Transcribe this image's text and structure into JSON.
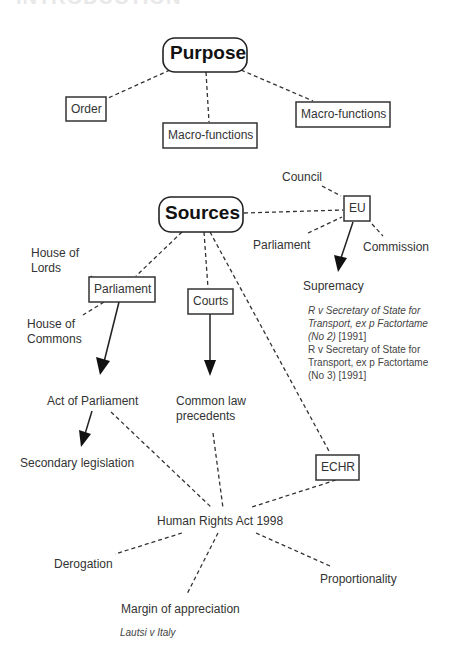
{
  "heading": "INTRODUCTION",
  "purpose": {
    "title": "Purpose",
    "children": [
      "Order",
      "Macro-functions",
      "Macro-functions"
    ]
  },
  "sources": {
    "title": "Sources",
    "eu": {
      "label": "EU",
      "institutions": [
        "Council",
        "Parliament",
        "Commission"
      ],
      "result": "Supremacy",
      "cases": [
        {
          "italic": "R v Secretary of State for Transport, ex p Factortame (No 2)",
          "line1": "R v Secretary of State for",
          "line2": "Transport, ex p Factortame",
          "line3": "(No 2)",
          "year": " [1991]"
        },
        {
          "line1": "R v Secretary of State for",
          "line2": "Transport, ex p Factortame",
          "line3": "(No 3) [1991]"
        }
      ]
    },
    "parliament": {
      "label": "Parliament",
      "house_lords_1": "House of",
      "house_lords_2": "Lords",
      "house_commons_1": "House of",
      "house_commons_2": "Commons",
      "act": "Act of Parliament",
      "secondary": "Secondary legislation"
    },
    "courts": {
      "label": "Courts",
      "result_1": "Common law",
      "result_2": "precedents"
    },
    "echr": {
      "label": "ECHR"
    }
  },
  "hra": {
    "title": "Human Rights Act 1998",
    "children": [
      "Derogation",
      "Margin of appreciation",
      "Proportionality"
    ],
    "margin_case": "Lautsi v Italy"
  }
}
